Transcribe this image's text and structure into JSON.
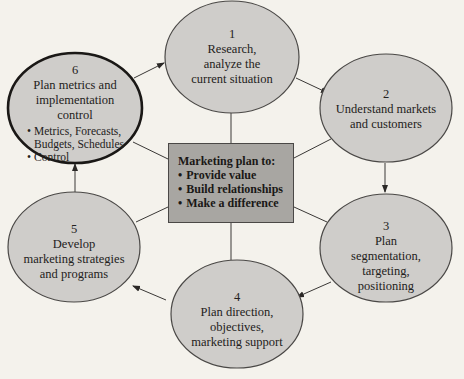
{
  "diagram": {
    "colors": {
      "background": "#f4f2ec",
      "ellipse_fill": "#cfcdca",
      "ellipse_stroke": "#4a4846",
      "highlight_stroke": "#1a1816",
      "center_fill": "#a8a6a2",
      "line": "#3a3836"
    },
    "center": {
      "title": "Marketing plan to:",
      "bullets": [
        "Provide value",
        "Build relationships",
        "Make a difference"
      ],
      "bullet_glyph": "•"
    },
    "steps": [
      {
        "number": "1",
        "lines": [
          "Research,",
          "analyze the",
          "current situation"
        ]
      },
      {
        "number": "2",
        "lines": [
          "Understand markets",
          "and customers"
        ]
      },
      {
        "number": "3",
        "lines": [
          "Plan",
          "segmentation,",
          "targeting,",
          "positioning"
        ]
      },
      {
        "number": "4",
        "lines": [
          "Plan direction,",
          "objectives,",
          "marketing support"
        ]
      },
      {
        "number": "5",
        "lines": [
          "Develop",
          "marketing strategies",
          "and programs"
        ]
      },
      {
        "number": "6",
        "lines": [
          "Plan metrics and",
          "implementation",
          "control"
        ],
        "bullets": [
          {
            "text": "Metrics, Forecasts,",
            "bullet": true
          },
          {
            "text": "Budgets, Schedules",
            "bullet": false
          },
          {
            "text": "Control",
            "bullet": true
          }
        ],
        "highlighted": true
      }
    ],
    "flow": [
      "1 → 2",
      "2 → 3",
      "3 → 4",
      "4 → 5",
      "5 → 6",
      "6 → 1"
    ]
  }
}
